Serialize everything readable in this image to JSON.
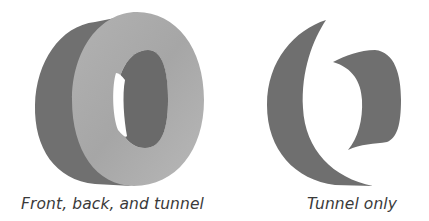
{
  "figures": [
    {
      "id": "left",
      "caption": "Front, back, and tunnel",
      "depicts": "extruded-letter-O-full"
    },
    {
      "id": "right",
      "caption": "Tunnel only",
      "depicts": "extruded-letter-O-tunnel-only"
    }
  ],
  "colors": {
    "front_face": "#a8a8a8",
    "front_face_light": "#bdbdbd",
    "side_dark": "#6e6e6e",
    "inner_tunnel": "#6a6a6a",
    "tunnel_only": "#6f6f6f",
    "background": "#ffffff",
    "caption_text": "#3a3a3a"
  }
}
